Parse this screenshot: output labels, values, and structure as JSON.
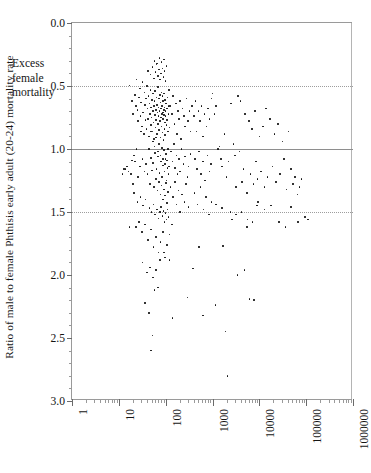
{
  "chart_data": {
    "type": "scatter",
    "title": "",
    "xlabel": "",
    "ylabel": "Ratio of male to female Phthisis early adult (20-24) mortality rate",
    "xscale": "log",
    "yscale": "linear",
    "y_inverted": true,
    "xlim": [
      1,
      1000000
    ],
    "ylim": [
      0.0,
      3.0
    ],
    "x_ticklabels": [
      "1",
      "10",
      "100",
      "1000",
      "10000",
      "100000",
      "1000000"
    ],
    "x_tickvalues": [
      1,
      10,
      100,
      1000,
      10000,
      100000,
      1000000
    ],
    "y_ticklabels": [
      "0.0",
      "0.5",
      "1.0",
      "1.5",
      "2.0",
      "2.5",
      "3.0"
    ],
    "y_tickvalues": [
      0.0,
      0.5,
      1.0,
      1.5,
      2.0,
      2.5,
      3.0
    ],
    "grid": "horizontal",
    "gridlines": [
      {
        "y": 0.5,
        "style": "dotted"
      },
      {
        "y": 1.0,
        "style": "solid"
      },
      {
        "y": 1.5,
        "style": "dotted"
      }
    ],
    "annotations": [
      {
        "text": "Excess\nfemale\nmortality",
        "x": 6,
        "y": 0.72
      }
    ],
    "marker": {
      "shape": "circle",
      "color": "#0a0a0a",
      "size": 1.6
    },
    "legend": null,
    "points": [
      [
        17,
        0.495
      ],
      [
        19,
        0.62
      ],
      [
        20,
        0.72
      ],
      [
        22,
        0.57
      ],
      [
        23,
        0.66
      ],
      [
        24,
        0.45
      ],
      [
        25,
        0.69
      ],
      [
        26,
        0.78
      ],
      [
        27,
        0.59
      ],
      [
        28,
        0.52
      ],
      [
        29,
        0.74
      ],
      [
        30,
        0.63
      ],
      [
        31,
        0.82
      ],
      [
        32,
        0.47
      ],
      [
        33,
        0.71
      ],
      [
        34,
        0.88
      ],
      [
        35,
        0.55
      ],
      [
        36,
        0.65
      ],
      [
        37,
        0.77
      ],
      [
        38,
        0.6
      ],
      [
        39,
        0.84
      ],
      [
        40,
        0.5
      ],
      [
        41,
        0.68
      ],
      [
        42,
        0.76
      ],
      [
        43,
        0.58
      ],
      [
        44,
        0.9
      ],
      [
        45,
        0.64
      ],
      [
        46,
        0.72
      ],
      [
        47,
        0.53
      ],
      [
        48,
        0.81
      ],
      [
        49,
        0.67
      ],
      [
        50,
        0.75
      ],
      [
        51,
        0.61
      ],
      [
        52,
        0.86
      ],
      [
        53,
        0.7
      ],
      [
        54,
        0.56
      ],
      [
        55,
        0.79
      ],
      [
        56,
        0.66
      ],
      [
        57,
        0.92
      ],
      [
        58,
        0.62
      ],
      [
        59,
        0.73
      ],
      [
        60,
        0.54
      ],
      [
        61,
        0.83
      ],
      [
        62,
        0.69
      ],
      [
        63,
        0.77
      ],
      [
        64,
        0.59
      ],
      [
        65,
        0.88
      ],
      [
        66,
        0.65
      ],
      [
        67,
        0.71
      ],
      [
        68,
        0.51
      ],
      [
        69,
        0.8
      ],
      [
        70,
        0.67
      ],
      [
        71,
        0.74
      ],
      [
        72,
        0.6
      ],
      [
        73,
        0.85
      ],
      [
        74,
        0.7
      ],
      [
        75,
        0.57
      ],
      [
        76,
        0.78
      ],
      [
        77,
        0.63
      ],
      [
        78,
        0.91
      ],
      [
        79,
        0.68
      ],
      [
        80,
        0.75
      ],
      [
        81,
        0.55
      ],
      [
        82,
        0.82
      ],
      [
        83,
        0.72
      ],
      [
        84,
        0.66
      ],
      [
        85,
        0.58
      ],
      [
        86,
        0.87
      ],
      [
        87,
        0.71
      ],
      [
        88,
        0.76
      ],
      [
        89,
        0.62
      ],
      [
        90,
        0.93
      ],
      [
        91,
        0.69
      ],
      [
        92,
        0.73
      ],
      [
        93,
        0.56
      ],
      [
        94,
        0.84
      ],
      [
        95,
        0.67
      ],
      [
        96,
        0.79
      ],
      [
        97,
        0.61
      ],
      [
        98,
        0.89
      ],
      [
        99,
        0.7
      ],
      [
        100,
        0.74
      ],
      [
        102,
        0.64
      ],
      [
        104,
        0.81
      ],
      [
        106,
        0.68
      ],
      [
        108,
        0.77
      ],
      [
        110,
        0.59
      ],
      [
        112,
        0.86
      ],
      [
        114,
        0.72
      ],
      [
        116,
        0.66
      ],
      [
        118,
        0.53
      ],
      [
        120,
        0.83
      ],
      [
        42,
        0.38
      ],
      [
        47,
        0.41
      ],
      [
        52,
        0.35
      ],
      [
        56,
        0.44
      ],
      [
        61,
        0.39
      ],
      [
        64,
        0.33
      ],
      [
        68,
        0.42
      ],
      [
        72,
        0.37
      ],
      [
        76,
        0.45
      ],
      [
        80,
        0.4
      ],
      [
        85,
        0.36
      ],
      [
        90,
        0.43
      ],
      [
        95,
        0.38
      ],
      [
        100,
        0.46
      ],
      [
        105,
        0.34
      ],
      [
        58,
        0.3
      ],
      [
        66,
        0.32
      ],
      [
        74,
        0.28
      ],
      [
        82,
        0.31
      ],
      [
        91,
        0.29
      ],
      [
        48,
        0.86
      ],
      [
        53,
        0.94
      ],
      [
        58,
        0.98
      ],
      [
        63,
        0.91
      ],
      [
        68,
        1.02
      ],
      [
        73,
        0.96
      ],
      [
        78,
        1.05
      ],
      [
        83,
        0.99
      ],
      [
        88,
        1.08
      ],
      [
        93,
        1.01
      ],
      [
        98,
        1.12
      ],
      [
        103,
        1.04
      ],
      [
        108,
        1.09
      ],
      [
        113,
        1.0
      ],
      [
        118,
        1.14
      ],
      [
        44,
        1.0
      ],
      [
        49,
        1.07
      ],
      [
        54,
        1.11
      ],
      [
        59,
        1.03
      ],
      [
        64,
        1.16
      ],
      [
        69,
        1.06
      ],
      [
        74,
        1.19
      ],
      [
        79,
        1.1
      ],
      [
        84,
        1.22
      ],
      [
        89,
        1.13
      ],
      [
        94,
        1.18
      ],
      [
        99,
        1.08
      ],
      [
        104,
        1.25
      ],
      [
        109,
        1.15
      ],
      [
        114,
        1.2
      ],
      [
        38,
        1.12
      ],
      [
        41,
        1.2
      ],
      [
        46,
        1.28
      ],
      [
        51,
        1.17
      ],
      [
        57,
        1.3
      ],
      [
        62,
        1.24
      ],
      [
        67,
        1.33
      ],
      [
        72,
        1.26
      ],
      [
        77,
        1.36
      ],
      [
        82,
        1.29
      ],
      [
        87,
        1.4
      ],
      [
        92,
        1.32
      ],
      [
        97,
        1.37
      ],
      [
        102,
        1.27
      ],
      [
        107,
        1.43
      ],
      [
        112,
        1.34
      ],
      [
        30,
        0.86
      ],
      [
        32,
        1.08
      ],
      [
        35,
        1.18
      ],
      [
        28,
        1.14
      ],
      [
        26,
        1.22
      ],
      [
        24,
        1.0
      ],
      [
        22,
        1.1
      ],
      [
        20,
        1.28
      ],
      [
        18,
        1.2
      ],
      [
        16,
        1.18
      ],
      [
        14,
        1.16
      ],
      [
        21,
        1.35
      ],
      [
        25,
        1.42
      ],
      [
        29,
        1.38
      ],
      [
        33,
        1.45
      ],
      [
        37,
        1.4
      ],
      [
        45,
        1.47
      ],
      [
        50,
        1.5
      ],
      [
        55,
        1.44
      ],
      [
        60,
        1.52
      ],
      [
        65,
        1.48
      ],
      [
        70,
        1.55
      ],
      [
        75,
        1.5
      ],
      [
        80,
        1.46
      ],
      [
        85,
        1.53
      ],
      [
        90,
        1.49
      ],
      [
        95,
        1.58
      ],
      [
        100,
        1.51
      ],
      [
        105,
        1.56
      ],
      [
        110,
        1.48
      ],
      [
        115,
        1.54
      ],
      [
        125,
        0.66
      ],
      [
        135,
        0.72
      ],
      [
        145,
        0.58
      ],
      [
        155,
        0.8
      ],
      [
        165,
        0.64
      ],
      [
        175,
        0.88
      ],
      [
        185,
        0.7
      ],
      [
        195,
        0.76
      ],
      [
        205,
        0.62
      ],
      [
        215,
        0.92
      ],
      [
        230,
        0.68
      ],
      [
        245,
        0.74
      ],
      [
        260,
        0.82
      ],
      [
        280,
        0.6
      ],
      [
        300,
        0.78
      ],
      [
        320,
        0.7
      ],
      [
        340,
        0.86
      ],
      [
        360,
        0.66
      ],
      [
        130,
        1.02
      ],
      [
        140,
        1.1
      ],
      [
        150,
        0.96
      ],
      [
        160,
        1.15
      ],
      [
        170,
        1.05
      ],
      [
        180,
        1.2
      ],
      [
        190,
        1.08
      ],
      [
        200,
        1.18
      ],
      [
        220,
        1.0
      ],
      [
        240,
        1.12
      ],
      [
        260,
        1.06
      ],
      [
        290,
        1.22
      ],
      [
        310,
        1.14
      ],
      [
        340,
        1.04
      ],
      [
        128,
        1.3
      ],
      [
        142,
        1.38
      ],
      [
        158,
        1.26
      ],
      [
        172,
        1.44
      ],
      [
        188,
        1.33
      ],
      [
        205,
        1.5
      ],
      [
        225,
        1.36
      ],
      [
        250,
        1.42
      ],
      [
        275,
        1.28
      ],
      [
        310,
        1.46
      ],
      [
        400,
        0.74
      ],
      [
        430,
        0.62
      ],
      [
        460,
        0.86
      ],
      [
        500,
        0.7
      ],
      [
        540,
        0.78
      ],
      [
        580,
        0.66
      ],
      [
        620,
        0.9
      ],
      [
        680,
        0.72
      ],
      [
        740,
        0.82
      ],
      [
        800,
        0.68
      ],
      [
        870,
        0.76
      ],
      [
        950,
        0.6
      ],
      [
        420,
        1.08
      ],
      [
        470,
        1.16
      ],
      [
        520,
        1.02
      ],
      [
        570,
        1.2
      ],
      [
        630,
        1.1
      ],
      [
        700,
        1.25
      ],
      [
        780,
        1.05
      ],
      [
        860,
        1.18
      ],
      [
        940,
        1.12
      ],
      [
        410,
        1.35
      ],
      [
        480,
        1.44
      ],
      [
        550,
        1.3
      ],
      [
        640,
        1.48
      ],
      [
        730,
        1.38
      ],
      [
        840,
        1.52
      ],
      [
        960,
        1.42
      ],
      [
        1000,
        0.56
      ],
      [
        1100,
        0.72
      ],
      [
        1200,
        0.66
      ],
      [
        1300,
        1.0
      ],
      [
        1400,
        0.98
      ],
      [
        1500,
        1.08
      ],
      [
        1600,
        1.14
      ],
      [
        1800,
        0.88
      ],
      [
        2000,
        1.22
      ],
      [
        2200,
        1.1
      ],
      [
        2500,
        0.64
      ],
      [
        2800,
        0.96
      ],
      [
        3000,
        1.05
      ],
      [
        3200,
        1.3
      ],
      [
        3500,
        0.58
      ],
      [
        3800,
        1.02
      ],
      [
        4000,
        0.62
      ],
      [
        4300,
        1.26
      ],
      [
        4600,
        1.16
      ],
      [
        5000,
        0.72
      ],
      [
        5500,
        1.35
      ],
      [
        6000,
        0.78
      ],
      [
        6500,
        1.2
      ],
      [
        7000,
        0.84
      ],
      [
        7500,
        1.28
      ],
      [
        8000,
        0.7
      ],
      [
        8600,
        1.1
      ],
      [
        9200,
        1.24
      ],
      [
        10000,
        0.9
      ],
      [
        11000,
        1.18
      ],
      [
        12000,
        0.82
      ],
      [
        13000,
        1.3
      ],
      [
        14000,
        0.68
      ],
      [
        15000,
        1.22
      ],
      [
        17000,
        0.76
      ],
      [
        19000,
        1.14
      ],
      [
        21000,
        0.88
      ],
      [
        23000,
        1.26
      ],
      [
        25000,
        0.8
      ],
      [
        28000,
        1.2
      ],
      [
        31000,
        0.94
      ],
      [
        34000,
        1.08
      ],
      [
        38000,
        1.32
      ],
      [
        42000,
        0.86
      ],
      [
        47000,
        1.16
      ],
      [
        52000,
        1.28
      ],
      [
        58000,
        1.22
      ],
      [
        65000,
        1.36
      ],
      [
        72000,
        1.3
      ],
      [
        80000,
        1.24
      ],
      [
        95000,
        1.54
      ],
      [
        110000,
        1.56
      ],
      [
        1200,
        1.44
      ],
      [
        1600,
        1.47
      ],
      [
        2400,
        1.5
      ],
      [
        3200,
        1.52
      ],
      [
        4200,
        1.5
      ],
      [
        5600,
        1.56
      ],
      [
        7200,
        1.58
      ],
      [
        9500,
        1.42
      ],
      [
        13000,
        1.48
      ],
      [
        18000,
        1.45
      ],
      [
        26000,
        1.58
      ],
      [
        36000,
        1.62
      ],
      [
        48000,
        1.46
      ],
      [
        66000,
        1.58
      ],
      [
        23,
        1.62
      ],
      [
        27,
        1.58
      ],
      [
        31,
        1.66
      ],
      [
        36,
        1.6
      ],
      [
        42,
        1.72
      ],
      [
        48,
        1.64
      ],
      [
        55,
        1.78
      ],
      [
        62,
        1.7
      ],
      [
        70,
        1.82
      ],
      [
        78,
        1.74
      ],
      [
        88,
        1.66
      ],
      [
        98,
        1.86
      ],
      [
        108,
        1.76
      ],
      [
        120,
        1.68
      ],
      [
        135,
        1.6
      ],
      [
        32,
        1.9
      ],
      [
        40,
        1.98
      ],
      [
        46,
        1.94
      ],
      [
        54,
        2.02
      ],
      [
        62,
        1.96
      ],
      [
        75,
        1.88
      ],
      [
        92,
        1.82
      ],
      [
        120,
        1.88
      ],
      [
        36,
        2.22
      ],
      [
        44,
        2.3
      ],
      [
        52,
        2.48
      ],
      [
        48,
        2.6
      ],
      [
        58,
        2.12
      ],
      [
        68,
        2.1
      ],
      [
        140,
        2.34
      ],
      [
        290,
        2.18
      ],
      [
        380,
        1.95
      ],
      [
        510,
        1.78
      ],
      [
        620,
        2.32
      ],
      [
        1150,
        2.24
      ],
      [
        1900,
        2.45
      ],
      [
        2100,
        2.8
      ],
      [
        3400,
        2.0
      ],
      [
        4800,
        1.96
      ],
      [
        6200,
        2.19
      ],
      [
        7800,
        2.2
      ],
      [
        1700,
        1.77
      ],
      [
        2600,
        1.56
      ],
      [
        5400,
        1.62
      ],
      [
        8800,
        1.45
      ],
      [
        12,
        1.2
      ],
      [
        13,
        1.16
      ],
      [
        15,
        1.14
      ],
      [
        17,
        1.62
      ],
      [
        19,
        1.09
      ],
      [
        21,
        1.05
      ]
    ]
  },
  "figure": {
    "background": "#ffffff",
    "axis_color": "#9a9a9a",
    "text_color": "#141414",
    "gridline_color": "#9d9d9d"
  }
}
